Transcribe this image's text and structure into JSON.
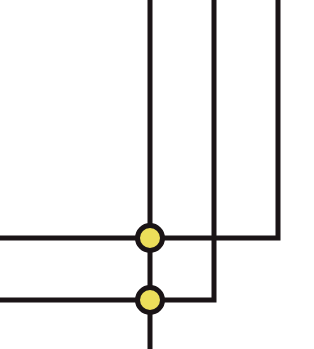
{
  "diagram": {
    "type": "wire-junction-diagram",
    "background": "#ffffff",
    "line_color": "#1a1416",
    "node_fill": "#ecde5a",
    "line_width": 5,
    "node_radius": 12,
    "wires": [
      {
        "id": "vertical-left",
        "points": [
          [
            150,
            0
          ],
          [
            150,
            349
          ]
        ]
      },
      {
        "id": "vertical-middle",
        "points": [
          [
            214,
            0
          ],
          [
            214,
            300
          ],
          [
            0,
            300
          ]
        ]
      },
      {
        "id": "vertical-right",
        "points": [
          [
            278,
            0
          ],
          [
            278,
            238
          ],
          [
            0,
            238
          ]
        ]
      }
    ],
    "junctions": [
      {
        "id": "junction-top",
        "x": 150,
        "y": 238
      },
      {
        "id": "junction-bottom",
        "x": 150,
        "y": 300
      }
    ]
  }
}
